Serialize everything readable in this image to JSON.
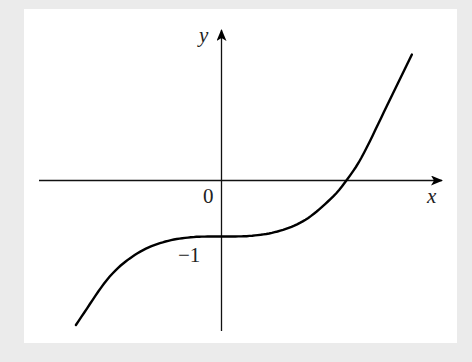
{
  "figure": {
    "x_axis_label": "x",
    "y_axis_label": "y",
    "origin_label": "0",
    "y_intercept_label": "−1"
  },
  "chart_data": {
    "type": "line",
    "title": "",
    "xlabel": "x",
    "ylabel": "y",
    "annotations": [
      "0",
      "−1"
    ],
    "key_points": [
      {
        "x": 0,
        "y": -1,
        "note": "stationary point of inflection (y-intercept)"
      },
      {
        "x": 2.23,
        "y": 0,
        "note": "x-intercept"
      }
    ],
    "x": [
      -2.6,
      -2.0,
      -1.5,
      -1.0,
      -0.5,
      0,
      0.5,
      1.0,
      1.5,
      2.0,
      2.23,
      2.5,
      3.0,
      3.4
    ],
    "y": [
      -2.58,
      -1.72,
      -1.3,
      -1.09,
      -1.01,
      -1.0,
      -0.99,
      -0.91,
      -0.7,
      -0.28,
      0.0,
      0.41,
      1.43,
      2.25
    ],
    "grid": false,
    "legend": null
  },
  "colors": {
    "background": "#ebebeb",
    "panel": "#ffffff",
    "ink": "#000000"
  }
}
